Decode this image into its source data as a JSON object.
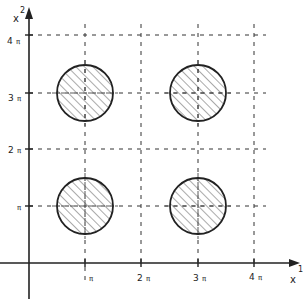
{
  "diagram": {
    "axes": {
      "x": {
        "name": "x",
        "index": "1"
      },
      "y": {
        "name": "x",
        "index": "2"
      }
    },
    "x_ticks": [
      {
        "num": "",
        "pi": "π"
      },
      {
        "num": "2",
        "pi": "π"
      },
      {
        "num": "3",
        "pi": "π"
      },
      {
        "num": "4",
        "pi": "π"
      }
    ],
    "y_ticks": [
      {
        "num": "",
        "pi": "π"
      },
      {
        "num": "2",
        "pi": "π"
      },
      {
        "num": "3",
        "pi": "π"
      },
      {
        "num": "4",
        "pi": "π"
      }
    ],
    "disks": [
      {
        "center": "(π, π)",
        "fill": "hatched"
      },
      {
        "center": "(3π, π)",
        "fill": "hatched"
      },
      {
        "center": "(π, 3π)",
        "fill": "hatched"
      },
      {
        "center": "(3π, 3π)",
        "fill": "hatched"
      }
    ],
    "colors": {
      "ink": "#222222",
      "background": "#ffffff"
    }
  }
}
